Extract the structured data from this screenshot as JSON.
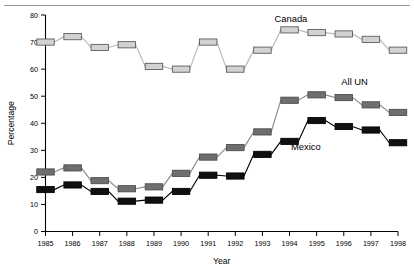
{
  "figure": {
    "name": "line-chart-percentage-by-year",
    "background": "#ffffff",
    "top_rule_color": "#9a9a9a"
  },
  "chart_data": {
    "type": "line",
    "title": "",
    "subtitle": "",
    "xlabel": "Year",
    "ylabel": "Percentage",
    "x": [
      1985,
      1986,
      1987,
      1988,
      1989,
      1990,
      1991,
      1992,
      1993,
      1994,
      1995,
      1996,
      1997,
      1998
    ],
    "xtick_labels": [
      "1985",
      "1986",
      "1987",
      "1988",
      "1989",
      "1990",
      "1991",
      "1992",
      "1993",
      "1994",
      "1995",
      "1996",
      "1997",
      "1998"
    ],
    "ytick_labels": [
      "0",
      "10",
      "20",
      "30",
      "40",
      "50",
      "60",
      "70",
      "80"
    ],
    "yticks": [
      0,
      10,
      20,
      30,
      40,
      50,
      60,
      70,
      80
    ],
    "ylim": [
      0,
      80
    ],
    "xlim": [
      1985,
      1998
    ],
    "grid": false,
    "legend_position": "inline-annotations",
    "marker_style": "horizontal-bar",
    "series": [
      {
        "name": "Canada",
        "color": "#d2d2d2",
        "edge_color": "#555555",
        "line_color": "#b9b9b9",
        "label_x": 1994.05,
        "label_y": 77.5,
        "values": [
          70.0,
          72.0,
          68.0,
          69.0,
          61.0,
          60.0,
          70.0,
          60.0,
          67.0,
          74.5,
          73.5,
          73.0,
          71.0,
          67.0
        ]
      },
      {
        "name": "All UN",
        "color": "#6e6e6e",
        "edge_color": "#4a4a4a",
        "line_color": "#8a8a8a",
        "label_x": 1996.4,
        "label_y": 54.0,
        "values": [
          22.0,
          23.5,
          18.8,
          15.8,
          16.5,
          21.5,
          27.5,
          31.0,
          36.8,
          48.5,
          50.5,
          49.5,
          46.8,
          44.0
        ]
      },
      {
        "name": "Mexico",
        "color": "#101010",
        "edge_color": "#000000",
        "line_color": "#000000",
        "label_x": 1994.6,
        "label_y": 30.0,
        "values": [
          15.5,
          17.2,
          14.8,
          11.2,
          11.6,
          14.8,
          20.8,
          20.5,
          28.5,
          33.3,
          41.0,
          38.8,
          37.5,
          32.8
        ]
      }
    ]
  }
}
